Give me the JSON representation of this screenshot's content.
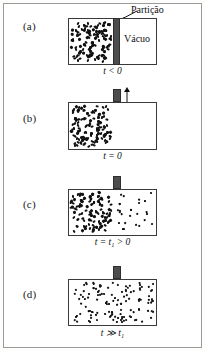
{
  "figure": {
    "title_annotation": "Partição",
    "vacuum_label": "Vácuo",
    "panels": [
      {
        "id": "a",
        "label": "(a)",
        "time_prefix": "t",
        "time_operator": " < ",
        "time_value": "0",
        "time_label": "t < 0",
        "partition_state": "closed",
        "gas_fill_fraction": 0.5,
        "right_side": "vacuum",
        "dot_count_left": 118,
        "dot_count_right": 0
      },
      {
        "id": "b",
        "label": "(b)",
        "time_prefix": "t",
        "time_operator": " = ",
        "time_value": "0",
        "time_label": "t = 0",
        "partition_state": "lifting",
        "gas_fill_fraction": 0.5,
        "right_side": "vacuum",
        "dot_count_left": 118,
        "dot_count_right": 0
      },
      {
        "id": "c",
        "label": "(c)",
        "time_prefix": "t",
        "time_operator": " = ",
        "time_value": "t₁ > 0",
        "time_label": "t = t₁ > 0",
        "partition_state": "removed",
        "gas_fill_fraction": 0.52,
        "right_side": "expanding",
        "dot_count_left": 110,
        "dot_count_right": 26
      },
      {
        "id": "d",
        "label": "(d)",
        "time_prefix": "t",
        "time_operator": " ≫ ",
        "time_value": "t₁",
        "time_label": "t ≫ t₁",
        "partition_state": "removed",
        "gas_fill_fraction": 1.0,
        "right_side": "uniform",
        "dot_count_left": 62,
        "dot_count_right": 62
      }
    ],
    "colors": {
      "partition": "#4d4d4d",
      "box_border": "#3a3a3a",
      "dot": "#111111",
      "frame_border": "#9a9a9a",
      "background": "#ffffff"
    },
    "icons": {
      "arrow_up": "arrow-up-icon",
      "callout_pointer": "callout-leader-icon"
    }
  }
}
